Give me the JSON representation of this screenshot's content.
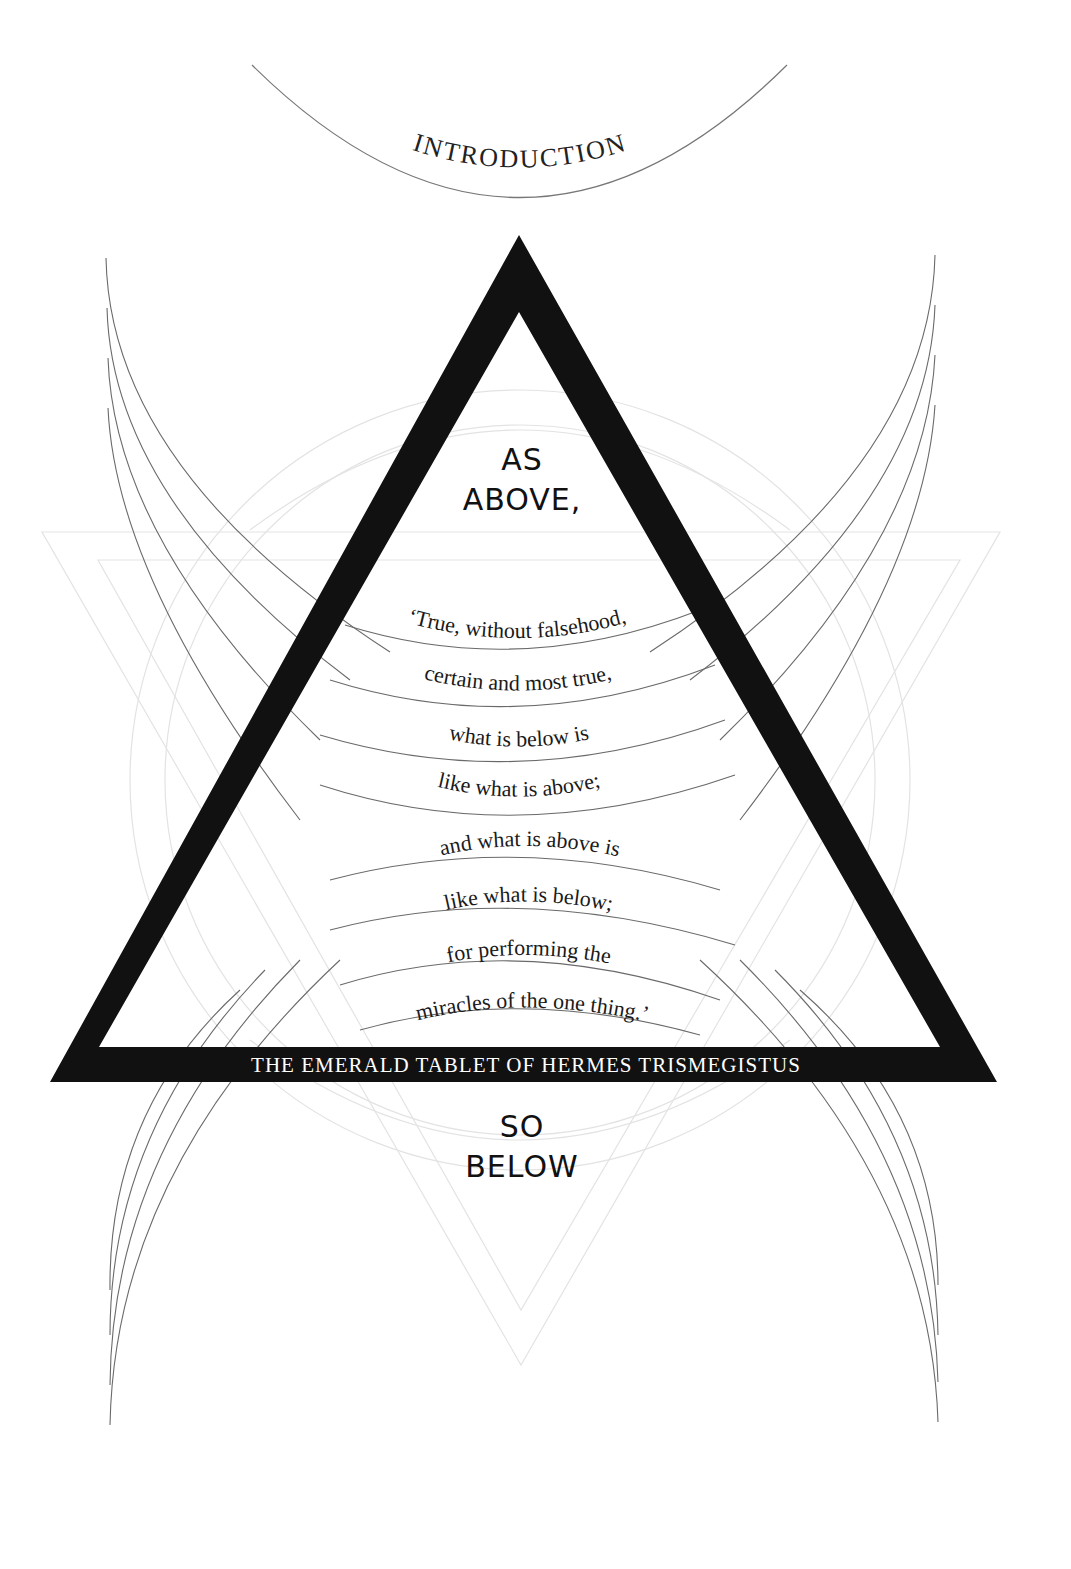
{
  "page": {
    "section_title": "INTRODUCTION",
    "top_heading": [
      "AS",
      "ABOVE,"
    ],
    "bottom_heading": [
      "SO",
      "BELOW"
    ],
    "verse_lines": [
      "‘True, without falsehood,",
      "certain and most true,",
      "what is below is",
      "like what is above;",
      "and what is above is",
      "like what is below;",
      "for performing the",
      "miracles of the one thing.’"
    ],
    "banner": "THE EMERALD TABLET OF HERMES TRISMEGISTUS",
    "colors": {
      "ink": "#111111",
      "line": "#6e6e6e",
      "faint_line": "#e2e2e2",
      "paper": "#ffffff"
    }
  }
}
